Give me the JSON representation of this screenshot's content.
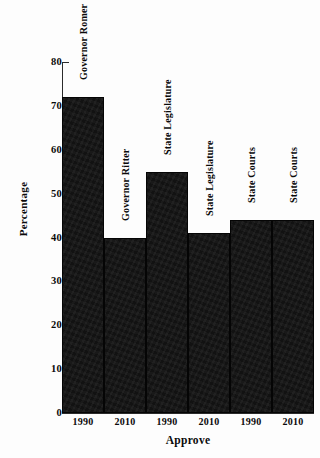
{
  "chart_data": {
    "type": "bar",
    "title": "",
    "xlabel": "Approve",
    "ylabel": "Percentage",
    "ylim": [
      0,
      80
    ],
    "yticks": [
      80,
      70,
      60,
      50,
      40,
      30,
      20,
      10,
      0
    ],
    "grid": false,
    "legend": "none",
    "categories": [
      "1990",
      "2010",
      "1990",
      "2010",
      "1990",
      "2010"
    ],
    "bar_annotations": [
      "Governor Romer",
      "Governor Ritter",
      "State Legislature",
      "State Legislature",
      "State Courts",
      "State Courts"
    ],
    "values": [
      72,
      40,
      55,
      41,
      44,
      44
    ],
    "bars": [
      {
        "group": "Governor Romer",
        "year": "1990",
        "value": 72
      },
      {
        "group": "Governor Ritter",
        "year": "2010",
        "value": 40
      },
      {
        "group": "State Legislature",
        "year": "1990",
        "value": 55
      },
      {
        "group": "State Legislature",
        "year": "2010",
        "value": 41
      },
      {
        "group": "State Courts",
        "year": "1990",
        "value": 44
      },
      {
        "group": "State Courts",
        "year": "2010",
        "value": 44
      }
    ],
    "colors": {
      "bar_fill": "#121212",
      "axis": "#2b2b2b",
      "background": "#fdfdfd",
      "text": "#0a0a0a"
    }
  }
}
